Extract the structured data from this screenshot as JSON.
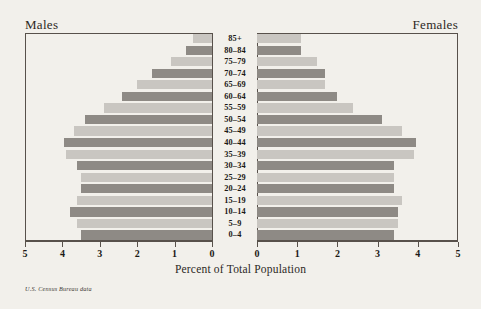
{
  "header": {
    "left_label": "Males",
    "right_label": "Females"
  },
  "axis": {
    "x_title": "Percent of Total Population",
    "left_ticks": [
      "5",
      "4",
      "3",
      "2",
      "1",
      "0"
    ],
    "right_ticks": [
      "0",
      "1",
      "2",
      "3",
      "4",
      "5"
    ]
  },
  "source_note": "U.S. Census Bureau data",
  "colors": {
    "background": "#f2f0eb",
    "bar_light": "#c9c6c1",
    "bar_dark": "#8e8a85",
    "frame": "#58514b",
    "text": "#231f1c"
  },
  "chart_data": {
    "type": "bar",
    "title": "",
    "subtitle": "",
    "xlabel": "Percent of Total Population",
    "ylabel": "",
    "xlim": [
      0,
      5
    ],
    "grid": false,
    "legend": "none",
    "orientation": "horizontal",
    "layout": "population-pyramid",
    "categories": [
      "0–4",
      "5–9",
      "10–14",
      "15–19",
      "20–24",
      "25–29",
      "30–34",
      "35–39",
      "40–44",
      "45–49",
      "50–54",
      "55–59",
      "60–64",
      "65–69",
      "70–74",
      "75–79",
      "80–84",
      "85+"
    ],
    "series": [
      {
        "name": "Males",
        "direction": "left",
        "values": [
          3.5,
          3.6,
          3.8,
          3.6,
          3.5,
          3.5,
          3.6,
          3.9,
          3.95,
          3.7,
          3.4,
          2.9,
          2.4,
          2.0,
          1.6,
          1.1,
          0.7,
          0.5
        ]
      },
      {
        "name": "Females",
        "direction": "right",
        "values": [
          3.4,
          3.5,
          3.5,
          3.6,
          3.4,
          3.4,
          3.4,
          3.9,
          3.95,
          3.6,
          3.1,
          2.4,
          2.0,
          1.7,
          1.7,
          1.5,
          1.1,
          1.1
        ]
      }
    ],
    "bar_shading": [
      "dark",
      "light",
      "dark",
      "light",
      "dark",
      "light",
      "dark",
      "light",
      "dark",
      "light",
      "dark",
      "light",
      "dark",
      "light",
      "dark",
      "light",
      "dark",
      "light"
    ]
  }
}
